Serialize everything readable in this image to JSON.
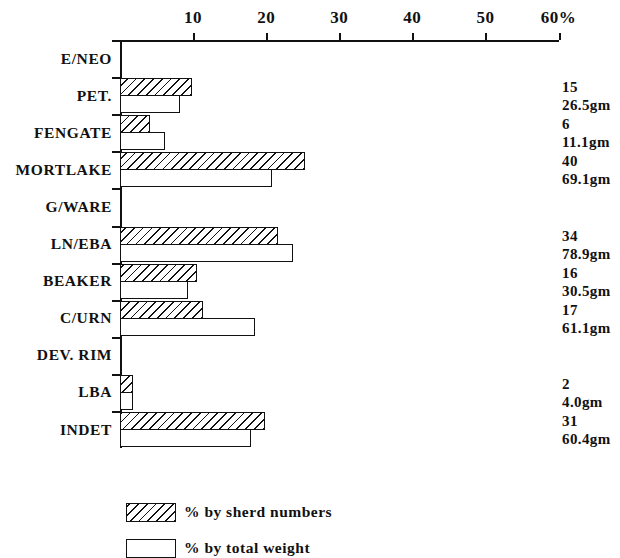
{
  "chart_data": {
    "type": "bar",
    "orientation": "horizontal",
    "title": "",
    "xlabel": "",
    "ylabel": "",
    "xlim": [
      0,
      60
    ],
    "grid": false,
    "axis_suffix": "%",
    "tick_values": [
      10,
      20,
      30,
      40,
      50,
      60
    ],
    "tick_labels": [
      "10",
      "20",
      "30",
      "40",
      "50",
      "60%"
    ],
    "legend_position": "bottom-left",
    "categories": [
      "E/NEO",
      "PET.",
      "FENGATE",
      "MORTLAKE",
      "G/WARE",
      "LN/EBA",
      "BEAKER",
      "C/URN",
      "DEV. RIM",
      "LBA",
      "INDET"
    ],
    "series": [
      {
        "name": "% by sherd numbers",
        "pattern": "hatched",
        "values": [
          0,
          9.9,
          4.1,
          25.3,
          0,
          21.6,
          10.5,
          11.4,
          0,
          1.8,
          19.9
        ]
      },
      {
        "name": "% by total weight",
        "pattern": "open",
        "values": [
          0,
          8.2,
          6.2,
          20.8,
          0,
          23.7,
          9.3,
          18.5,
          0,
          1.8,
          17.9
        ]
      }
    ],
    "annotations": {
      "sherd_counts": [
        "",
        "15",
        "6",
        "40",
        "",
        "34",
        "16",
        "17",
        "",
        "2",
        "31"
      ],
      "weights": [
        "",
        "26.5gm",
        "11.1gm",
        "69.1gm",
        "",
        "78.9gm",
        "30.5gm",
        "61.1gm",
        "",
        "4.0gm",
        "60.4gm"
      ]
    }
  },
  "legend": {
    "items": [
      {
        "label": "% by sherd numbers",
        "pattern": "hatched"
      },
      {
        "label": "% by total weight",
        "pattern": "open"
      }
    ]
  },
  "colors": {
    "ink": "#111111",
    "background": "#ffffff"
  }
}
